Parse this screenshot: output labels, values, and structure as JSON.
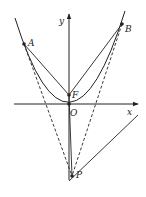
{
  "diagram": {
    "type": "geometry",
    "labels": {
      "x_axis": "x",
      "y_axis": "y",
      "origin": "O",
      "focus": "F",
      "point_a": "A",
      "point_b": "B",
      "point_p": "P"
    },
    "colors": {
      "stroke": "#222222",
      "background": "#ffffff"
    }
  }
}
